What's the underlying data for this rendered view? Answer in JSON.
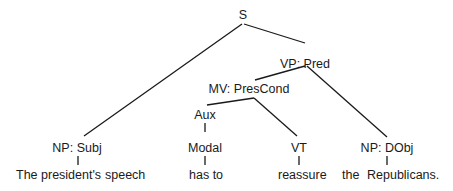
{
  "diagram": {
    "type": "syntax-tree",
    "nodes": {
      "s": "S",
      "vp": "VP: Pred",
      "mv": "MV: PresCond",
      "aux": "Aux",
      "np_subj": "NP: Subj",
      "modal": "Modal",
      "vt": "VT",
      "np_dobj": "NP: DObj"
    },
    "words": {
      "subj_det": "The president's",
      "subj_noun": "speech",
      "modal": "has to",
      "verb": "reassure",
      "obj_det": "the",
      "obj_noun": "Republicans."
    },
    "edges": [
      {
        "from": "S",
        "to": "NP: Subj"
      },
      {
        "from": "S",
        "to": "VP: Pred"
      },
      {
        "from": "VP: Pred",
        "to": "MV: PresCond"
      },
      {
        "from": "VP: Pred",
        "to": "NP: DObj"
      },
      {
        "from": "MV: PresCond",
        "to": "Aux"
      },
      {
        "from": "MV: PresCond",
        "to": "VT"
      },
      {
        "from": "Aux",
        "to": "Modal"
      },
      {
        "from": "Modal",
        "to": "has to"
      },
      {
        "from": "VT",
        "to": "reassure"
      },
      {
        "from": "NP: Subj",
        "to": "The president's speech"
      },
      {
        "from": "NP: DObj",
        "to": "the Republicans."
      }
    ]
  }
}
